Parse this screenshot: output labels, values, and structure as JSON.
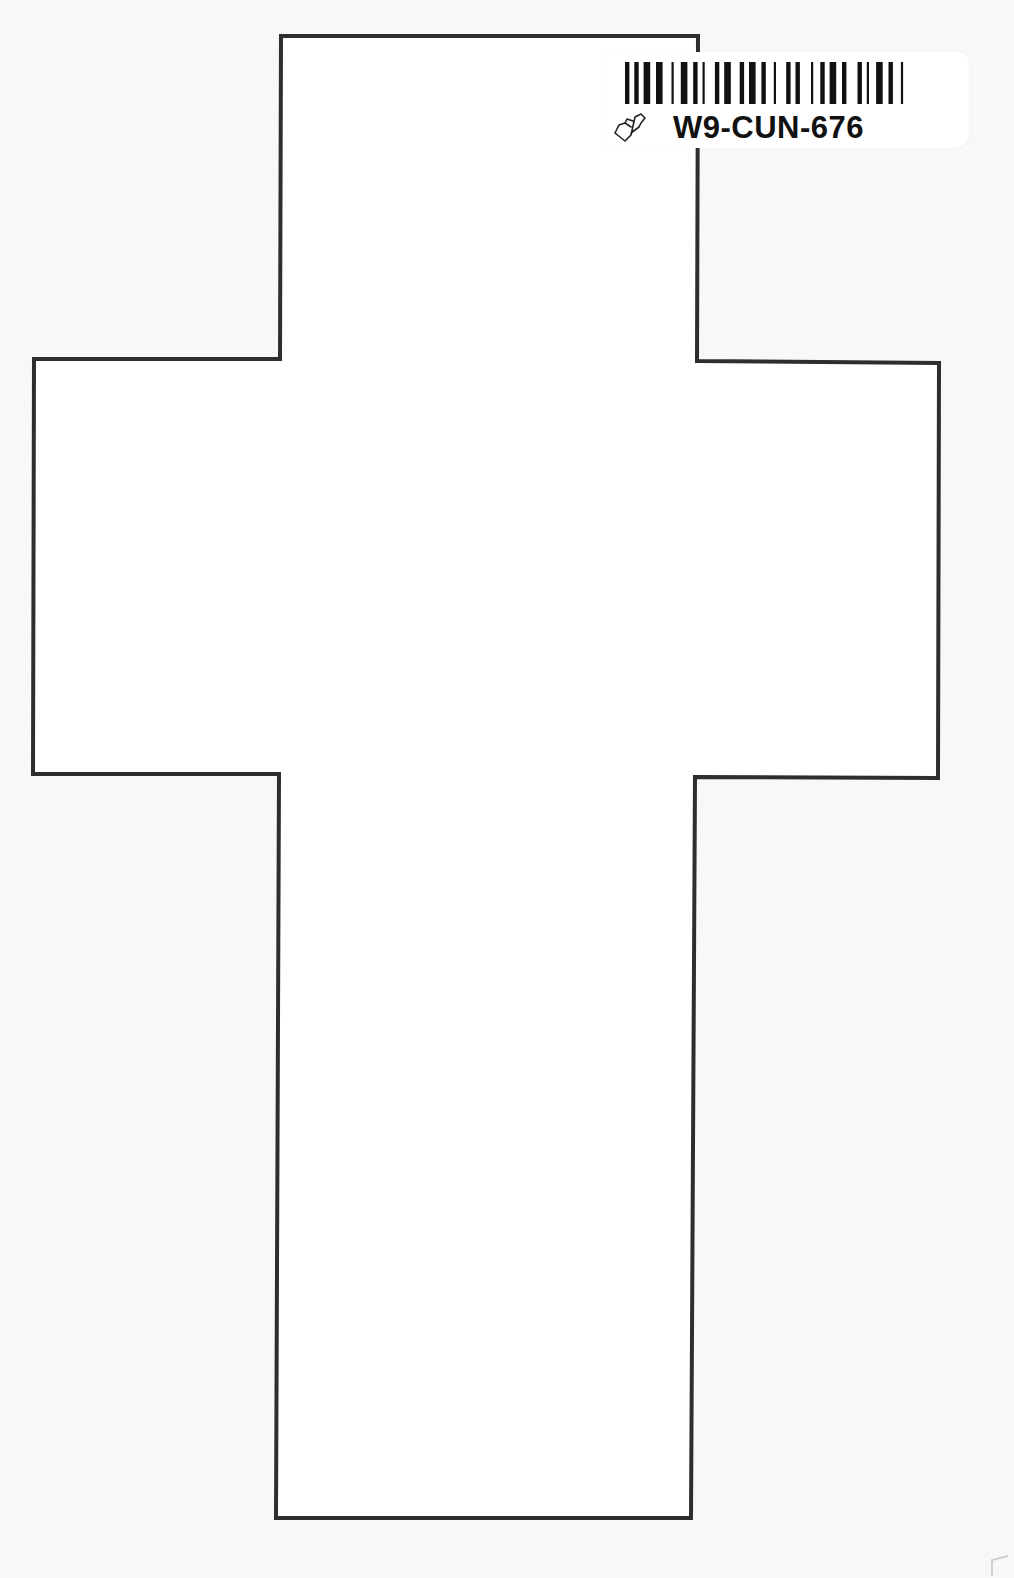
{
  "page": {
    "type": "printed coloring page",
    "background_color": "#f8f8f7",
    "outline_color": "#2e2e2e"
  },
  "cross_outline": {
    "shape": "cross",
    "points": [
      [
        281,
        36
      ],
      [
        698,
        36
      ],
      [
        697,
        361
      ],
      [
        939,
        363
      ],
      [
        938,
        778
      ],
      [
        695,
        777
      ],
      [
        691,
        1518
      ],
      [
        276,
        1518
      ],
      [
        279,
        774
      ],
      [
        33,
        774
      ],
      [
        34,
        359
      ],
      [
        280,
        359
      ]
    ]
  },
  "barcode_label": {
    "code": "W9-CUN-676",
    "icon": "heart-book-icon"
  }
}
